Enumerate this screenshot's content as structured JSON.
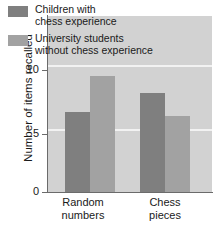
{
  "chart_data": {
    "type": "bar",
    "title": "",
    "xlabel": "",
    "ylabel": "Number of items recalled",
    "categories": [
      "Random\nnumbers",
      "Chess\npieces"
    ],
    "category_labels_flat": [
      "Random numbers",
      "Chess pieces"
    ],
    "series": [
      {
        "name": "Children with\nchess experience",
        "name_flat": "Children with chess experience",
        "color": "#7f7f7f",
        "values": [
          6.3,
          7.8
        ]
      },
      {
        "name": "University students\nwithout chess experience",
        "name_flat": "University students without chess experience",
        "color": "#a2a2a2",
        "values": [
          9.2,
          6.0
        ]
      }
    ],
    "ylim": [
      0,
      13.9
    ],
    "yticks": [
      0,
      5,
      10
    ],
    "ytick_labels": [
      "0",
      "5",
      "10"
    ],
    "grid": true,
    "gridline_color": "#f2f2f2",
    "legend_position": "top-left-inside",
    "plot_background": "#d2d2d2",
    "axis_color": "#6b6b6b",
    "text_color": "#1a1a1a"
  },
  "legend": {
    "items": [
      {
        "label": "Children with\nchess experience",
        "color": "#7f7f7f"
      },
      {
        "label": "University students\nwithout chess experience",
        "color": "#a2a2a2"
      }
    ]
  },
  "axes": {
    "y_title": "Number of items recalled",
    "y_tick_0": "0",
    "y_tick_5": "5",
    "y_tick_10": "10",
    "x_cat_0": "Random\nnumbers",
    "x_cat_1": "Chess\npieces"
  }
}
